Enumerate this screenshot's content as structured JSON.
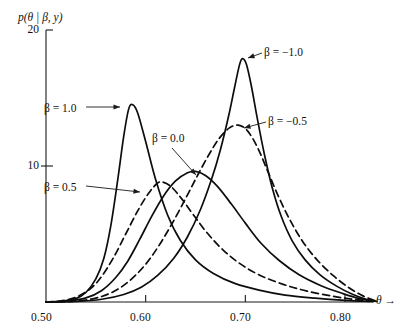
{
  "figure": {
    "background": "#ffffff",
    "ink_color": "#0d0d0d"
  },
  "axes": {
    "y_axis_title": "p(θ | β, y)",
    "x_axis_title": "θ →",
    "x_tick_labels": [
      "0.50",
      "0.60",
      "0.70",
      "0.80"
    ],
    "y_tick_labels": [
      "20",
      "10"
    ]
  },
  "chart_data": {
    "type": "line",
    "title": "",
    "subtitle": "",
    "xlabel": "θ",
    "ylabel": "p(θ | β, y)",
    "xlim": [
      0.5,
      0.83
    ],
    "ylim": [
      0,
      20
    ],
    "xticks": [
      0.5,
      0.6,
      0.7,
      0.8
    ],
    "xticklabels": [
      "0.50",
      "0.60",
      "0.70",
      "0.80"
    ],
    "yticks": [
      10,
      20
    ],
    "yticklabels": [
      "10",
      "20"
    ],
    "grid": false,
    "legend": "inline-annotations",
    "legend_position": "inline",
    "series": [
      {
        "name": "β = 1.0",
        "beta": 1.0,
        "style": "solid",
        "peak_x": 0.585,
        "peak_y": 14.5,
        "label_text": "β = 1.0",
        "label_x": 44,
        "label_y": 103,
        "leader": [
          [
            86,
            107
          ],
          [
            120,
            107
          ]
        ],
        "points": [
          [
            0.5,
            0.0
          ],
          [
            0.515,
            0.05
          ],
          [
            0.53,
            0.25
          ],
          [
            0.54,
            0.7
          ],
          [
            0.55,
            1.7
          ],
          [
            0.558,
            3.2
          ],
          [
            0.565,
            5.6
          ],
          [
            0.572,
            9.0
          ],
          [
            0.578,
            12.2
          ],
          [
            0.583,
            14.2
          ],
          [
            0.587,
            14.5
          ],
          [
            0.592,
            13.9
          ],
          [
            0.6,
            11.8
          ],
          [
            0.61,
            9.0
          ],
          [
            0.622,
            6.4
          ],
          [
            0.635,
            4.5
          ],
          [
            0.65,
            3.1
          ],
          [
            0.668,
            2.1
          ],
          [
            0.69,
            1.35
          ],
          [
            0.715,
            0.85
          ],
          [
            0.74,
            0.5
          ],
          [
            0.77,
            0.28
          ],
          [
            0.8,
            0.12
          ],
          [
            0.825,
            0.04
          ]
        ]
      },
      {
        "name": "β = 0.5",
        "beta": 0.5,
        "style": "dashed",
        "peak_x": 0.6145,
        "peak_y": 8.8,
        "label_text": "β = 0.5",
        "label_x": 44,
        "label_y": 182,
        "leader": [
          [
            86,
            186
          ],
          [
            140,
            192
          ]
        ],
        "points": [
          [
            0.5,
            0.0
          ],
          [
            0.515,
            0.08
          ],
          [
            0.53,
            0.35
          ],
          [
            0.545,
            1.0
          ],
          [
            0.556,
            1.9
          ],
          [
            0.568,
            3.3
          ],
          [
            0.58,
            5.0
          ],
          [
            0.592,
            6.7
          ],
          [
            0.603,
            8.0
          ],
          [
            0.612,
            8.75
          ],
          [
            0.618,
            8.8
          ],
          [
            0.626,
            8.45
          ],
          [
            0.636,
            7.6
          ],
          [
            0.648,
            6.4
          ],
          [
            0.662,
            5.05
          ],
          [
            0.678,
            3.8
          ],
          [
            0.695,
            2.8
          ],
          [
            0.715,
            1.95
          ],
          [
            0.738,
            1.3
          ],
          [
            0.762,
            0.8
          ],
          [
            0.788,
            0.42
          ],
          [
            0.81,
            0.18
          ],
          [
            0.828,
            0.05
          ]
        ]
      },
      {
        "name": "β = 0.0",
        "beta": 0.0,
        "style": "solid",
        "peak_x": 0.6485,
        "peak_y": 9.6,
        "label_text": "β = 0.0",
        "label_x": 152,
        "label_y": 133,
        "leader": [
          [
            172,
            148
          ],
          [
            196,
            175
          ]
        ],
        "points": [
          [
            0.5,
            0.0
          ],
          [
            0.52,
            0.06
          ],
          [
            0.54,
            0.3
          ],
          [
            0.556,
            0.85
          ],
          [
            0.57,
            1.8
          ],
          [
            0.582,
            3.0
          ],
          [
            0.594,
            4.6
          ],
          [
            0.606,
            6.3
          ],
          [
            0.618,
            7.8
          ],
          [
            0.63,
            8.9
          ],
          [
            0.642,
            9.5
          ],
          [
            0.65,
            9.6
          ],
          [
            0.66,
            9.3
          ],
          [
            0.672,
            8.5
          ],
          [
            0.686,
            7.2
          ],
          [
            0.7,
            5.8
          ],
          [
            0.716,
            4.3
          ],
          [
            0.734,
            3.05
          ],
          [
            0.754,
            2.0
          ],
          [
            0.776,
            1.2
          ],
          [
            0.798,
            0.62
          ],
          [
            0.815,
            0.25
          ],
          [
            0.83,
            0.06
          ]
        ]
      },
      {
        "name": "β = −0.5",
        "beta": -0.5,
        "style": "dashed",
        "peak_x": 0.6925,
        "peak_y": 13.0,
        "label_text": "β = −0.5",
        "label_x": 268,
        "label_y": 116,
        "leader": [
          [
            266,
            122
          ],
          [
            244,
            128
          ]
        ],
        "points": [
          [
            0.5,
            0.0
          ],
          [
            0.525,
            0.05
          ],
          [
            0.548,
            0.25
          ],
          [
            0.566,
            0.7
          ],
          [
            0.582,
            1.45
          ],
          [
            0.598,
            2.6
          ],
          [
            0.612,
            4.0
          ],
          [
            0.626,
            5.7
          ],
          [
            0.64,
            7.6
          ],
          [
            0.652,
            9.3
          ],
          [
            0.664,
            10.9
          ],
          [
            0.674,
            12.05
          ],
          [
            0.684,
            12.8
          ],
          [
            0.693,
            13.0
          ],
          [
            0.702,
            12.6
          ],
          [
            0.712,
            11.4
          ],
          [
            0.722,
            9.7
          ],
          [
            0.733,
            7.8
          ],
          [
            0.745,
            6.0
          ],
          [
            0.758,
            4.4
          ],
          [
            0.772,
            3.1
          ],
          [
            0.788,
            1.95
          ],
          [
            0.804,
            1.05
          ],
          [
            0.818,
            0.45
          ],
          [
            0.83,
            0.1
          ]
        ]
      },
      {
        "name": "β = −1.0",
        "beta": -1.0,
        "style": "solid",
        "peak_x": 0.6965,
        "peak_y": 17.9,
        "label_text": "β = −1.0",
        "label_x": 264,
        "label_y": 47,
        "leader": [
          [
            262,
            53
          ],
          [
            248,
            58
          ]
        ],
        "points": [
          [
            0.5,
            0.0
          ],
          [
            0.53,
            0.04
          ],
          [
            0.556,
            0.2
          ],
          [
            0.578,
            0.55
          ],
          [
            0.596,
            1.1
          ],
          [
            0.612,
            1.95
          ],
          [
            0.628,
            3.2
          ],
          [
            0.642,
            4.8
          ],
          [
            0.655,
            6.8
          ],
          [
            0.666,
            9.0
          ],
          [
            0.675,
            11.2
          ],
          [
            0.683,
            13.6
          ],
          [
            0.689,
            15.7
          ],
          [
            0.694,
            17.4
          ],
          [
            0.697,
            17.9
          ],
          [
            0.701,
            17.5
          ],
          [
            0.706,
            15.9
          ],
          [
            0.712,
            13.5
          ],
          [
            0.719,
            10.9
          ],
          [
            0.727,
            8.4
          ],
          [
            0.736,
            6.3
          ],
          [
            0.747,
            4.5
          ],
          [
            0.76,
            3.1
          ],
          [
            0.775,
            2.0
          ],
          [
            0.792,
            1.15
          ],
          [
            0.808,
            0.55
          ],
          [
            0.822,
            0.18
          ],
          [
            0.832,
            0.04
          ]
        ]
      }
    ]
  }
}
